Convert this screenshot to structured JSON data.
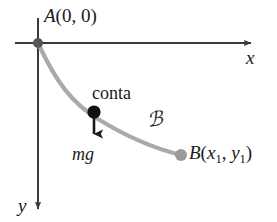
{
  "figure": {
    "background_color": "#ffffff",
    "axis_color": "#3a3a3a",
    "curve_color": "#a8a8a8",
    "particle_color": "#111111",
    "endpoint_color": "#9a9a9a",
    "origin_dot_color": "#555555"
  },
  "labels": {
    "point_a": "A(0, 0)",
    "point_a_name": "A",
    "point_a_coords": "(0, 0)",
    "axis_x": "x",
    "axis_y": "y",
    "particle": "conta",
    "force": "mg",
    "curve": "ℬ",
    "point_b_name": "B",
    "point_b_open": "(",
    "point_b_x": "x",
    "point_b_x_sub": "1",
    "point_b_sep": ", ",
    "point_b_y": "y",
    "point_b_y_sub": "1",
    "point_b_close": ")",
    "point_b_full": "B(x1, y1)"
  },
  "geometry": {
    "origin": {
      "x": 38,
      "y": 43
    },
    "x_axis_start": {
      "x": 15,
      "y": 43
    },
    "x_axis_end": {
      "x": 257,
      "y": 43
    },
    "y_axis_start": {
      "x": 38,
      "y": 18
    },
    "y_axis_end": {
      "x": 38,
      "y": 215
    },
    "particle_point": {
      "x": 94,
      "y": 112
    },
    "force_arrow_end": {
      "x": 94,
      "y": 143
    },
    "endpoint_b": {
      "x": 181,
      "y": 155
    }
  }
}
